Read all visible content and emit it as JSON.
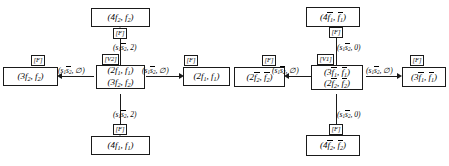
{
  "diagram": {
    "type": "state-transition-graph",
    "title": "",
    "nodes": [
      {
        "id": "n-top-left",
        "lines": [
          "(4f2, f2)"
        ]
      },
      {
        "id": "n-left",
        "lines": [
          "(3f2, f2)"
        ]
      },
      {
        "id": "n-center-left",
        "lines": [
          "(2f1, f1)",
          "(3f2, f2)"
        ]
      },
      {
        "id": "n-center",
        "lines": [
          "(2f1, f1)"
        ]
      },
      {
        "id": "n-center-right",
        "lines": [
          "(2f2bar, f2bar)"
        ]
      },
      {
        "id": "n-right-mid",
        "lines": [
          "(3f1bar, f1bar)",
          "(2f2bar, f2bar)"
        ]
      },
      {
        "id": "n-right",
        "lines": [
          "(3f1bar, f1bar)"
        ]
      },
      {
        "id": "n-top-right",
        "lines": [
          "(4f1bar, f1bar)"
        ]
      },
      {
        "id": "n-bottom-left",
        "lines": [
          "(4f1, f1)"
        ]
      },
      {
        "id": "n-bottom-right",
        "lines": [
          "(4f2bar, f2bar)"
        ]
      }
    ],
    "tags": {
      "F": "[F]",
      "V2": "[V2]",
      "V1": "[V1]"
    },
    "edge_labels": {
      "left_h": "(s1 s2bar, ∅)",
      "center_h": "(s1 s2bar, ∅)",
      "mid_h": "(s1 s2bar, ∅)",
      "right_h": "(s1 s2bar, ∅)",
      "up_left": "(s1 s2bar, 2)",
      "down_left": "(s1 s2bar, 2)",
      "up_right": "(s1 s2bar, 0)",
      "down_right": "(s1 s2bar, 0)"
    },
    "colors": {
      "stroke": "#1a1a1a",
      "background": "#ffffff",
      "text": "#000000"
    }
  }
}
